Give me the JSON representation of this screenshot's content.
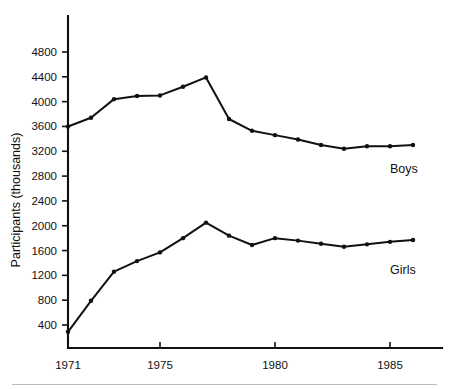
{
  "chart_data": {
    "type": "line",
    "title": "",
    "subtitle": "",
    "xlabel": "",
    "ylabel": "Participants  (thousands)",
    "x": [
      1971,
      1972,
      1973,
      1974,
      1975,
      1976,
      1977,
      1978,
      1979,
      1980,
      1981,
      1982,
      1983,
      1984,
      1985,
      1986
    ],
    "xlim": [
      1970.4,
      1986.6
    ],
    "ylim": [
      0,
      5100
    ],
    "ytick_values": [
      400,
      800,
      1200,
      1600,
      2000,
      2400,
      2800,
      3200,
      3600,
      4000,
      4400,
      4800
    ],
    "ytick_labels": [
      "400",
      "800",
      "1200",
      "1600",
      "2000",
      "2400",
      "2800",
      "3200",
      "3600",
      "4000",
      "4400",
      "4800"
    ],
    "xtick_values": [
      1971,
      1975,
      1980,
      1985
    ],
    "xtick_labels": [
      "1971",
      "1975",
      "1980",
      "1985"
    ],
    "grid": false,
    "legend_position": "inline-right",
    "series": [
      {
        "name": "Boys",
        "color": "#111111",
        "label_x": 1985.0,
        "label_y": 2850,
        "values": [
          3600,
          3740,
          4040,
          4090,
          4100,
          4240,
          4390,
          3720,
          3530,
          3460,
          3390,
          3300,
          3240,
          3280,
          3280,
          3300
        ]
      },
      {
        "name": "Girls",
        "color": "#111111",
        "label_x": 1985.0,
        "label_y": 1230,
        "values": [
          290,
          790,
          1260,
          1430,
          1570,
          1800,
          2050,
          1840,
          1690,
          1800,
          1760,
          1710,
          1660,
          1700,
          1740,
          1770
        ]
      }
    ],
    "annotations": []
  },
  "labels": {
    "boys": "Boys",
    "girls": "Girls",
    "y_axis_title": "Participants  (thousands)"
  }
}
